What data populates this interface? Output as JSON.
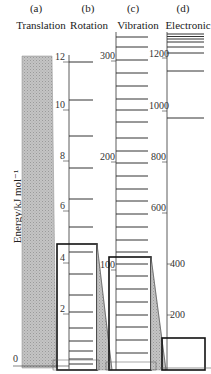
{
  "columns": [
    {
      "letter": "(a)",
      "title": "Translation"
    },
    {
      "letter": "(b)",
      "title": "Rotation"
    },
    {
      "letter": "(c)",
      "title": "Vibration"
    },
    {
      "letter": "(d)",
      "title": "Electronic"
    }
  ],
  "y_axis_label": "Energy/kJ mol⁻¹",
  "rotation_axis": {
    "ticks": [
      "12",
      "10",
      "8",
      "6",
      "4",
      "2",
      "0"
    ]
  },
  "vibration_axis": {
    "ticks": [
      "300",
      "200",
      "100"
    ]
  },
  "electronic_axis": {
    "ticks": [
      "1200",
      "1000",
      "800",
      "600",
      "400",
      "200"
    ]
  },
  "colors": {
    "line": "#222222",
    "shade": "#b8b8b8",
    "box": "#111111"
  }
}
